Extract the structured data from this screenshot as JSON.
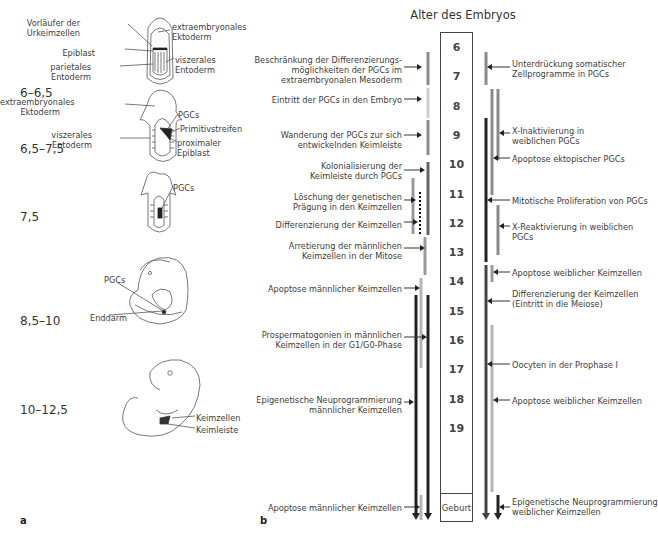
{
  "panel_a": {
    "letter": "a",
    "stages": [
      {
        "label": "6–6,5",
        "top": 86,
        "annotations": [
          {
            "text": "Vorläufer der\nUrkeimzellen",
            "x": 80,
            "y": 18,
            "align": "right"
          },
          {
            "text": "Epiblast",
            "x": 95,
            "y": 48,
            "align": "right"
          },
          {
            "text": "parietales\nEntoderm",
            "x": 91,
            "y": 62,
            "align": "right"
          },
          {
            "text": "extraembryonales\nEktoderm",
            "x": 172,
            "y": 22,
            "align": "left"
          },
          {
            "text": "viszerales\nEntoderm",
            "x": 175,
            "y": 55,
            "align": "left"
          }
        ]
      },
      {
        "label": "6,5–7,5",
        "top": 142,
        "annotations": [
          {
            "text": "extraembryonales\nEktoderm",
            "x": 60,
            "y": 97,
            "align": "right"
          },
          {
            "text": "viszerales\nEntoderm",
            "x": 92,
            "y": 130,
            "align": "right"
          },
          {
            "text": "PGCs",
            "x": 178,
            "y": 110,
            "align": "left"
          },
          {
            "text": "Primitivstreifen",
            "x": 180,
            "y": 124,
            "align": "left"
          },
          {
            "text": "proximaler\nEpiblast",
            "x": 177,
            "y": 138,
            "align": "left"
          }
        ]
      },
      {
        "label": "7,5",
        "top": 210,
        "annotations": [
          {
            "text": "PGCs",
            "x": 173,
            "y": 183,
            "align": "left"
          }
        ]
      },
      {
        "label": "8,5–10",
        "top": 314,
        "annotations": [
          {
            "text": "PGCs",
            "x": 104,
            "y": 275,
            "align": "left"
          },
          {
            "text": "Enddarm",
            "x": 90,
            "y": 313,
            "align": "left"
          }
        ]
      },
      {
        "label": "10–12,5",
        "top": 403,
        "annotations": [
          {
            "text": "Keimzellen",
            "x": 196,
            "y": 413,
            "align": "left"
          },
          {
            "text": "Keimleiste",
            "x": 196,
            "y": 425,
            "align": "left"
          }
        ]
      }
    ]
  },
  "panel_b": {
    "letter": "b",
    "title": "Alter des Embryos",
    "ages": [
      "6",
      "7",
      "8",
      "9",
      "10",
      "11",
      "12",
      "13",
      "14",
      "15",
      "16",
      "17",
      "18",
      "19"
    ],
    "birth_label": "Geburt",
    "left_events": [
      {
        "text": "Beschränkung der Differenzierungs-\nmöglichkeiten der PGCs im\nextraembryonalen Mesoderm",
        "y": 55,
        "arrow_y": 67,
        "arrow_to": 422
      },
      {
        "text": "Eintritt der PGCs in den Embryo",
        "y": 95,
        "arrow_y": 99,
        "arrow_to": 422
      },
      {
        "text": "Wanderung der PGCs zur sich\nentwickelnden Keimleiste",
        "y": 130,
        "arrow_y": 135,
        "arrow_to": 422
      },
      {
        "text": "Kolonialisierung der\nKeimleiste durch PGCs",
        "y": 161,
        "arrow_y": 170,
        "arrow_to": 425
      },
      {
        "text": "Löschung der genetischen\nPrägung in den Keimzellen",
        "y": 192,
        "arrow_y": 200,
        "arrow_to": 416
      },
      {
        "text": "Differenzierung der Keimzellen",
        "y": 220,
        "arrow_y": 222,
        "arrow_to": 418
      },
      {
        "text": "Arretierung der männlichen\nKeimzellen in der Mitose",
        "y": 241,
        "arrow_y": 248,
        "arrow_to": 425
      },
      {
        "text": "Apoptose männlicher Keimzellen",
        "y": 284,
        "arrow_y": 288,
        "arrow_to": 420
      },
      {
        "text": "Prospermatogonien in männlichen\nKeimzellen in der G1/G0-Phase",
        "y": 330,
        "arrow_y": 337,
        "arrow_to": 427
      },
      {
        "text": "Epigenetische Neuprogrammierung\nmännlicher Keimzellen",
        "y": 395,
        "arrow_y": 402,
        "arrow_to": 414
      },
      {
        "text": "Apoptose männlicher Keimzellen",
        "y": 503,
        "arrow_y": 507,
        "arrow_to": 420
      }
    ],
    "right_events": [
      {
        "text": "Unterdrückung somatischer\nZellprogramme in PGCs",
        "y": 59,
        "arrow_y": 67,
        "arrow_from": 487
      },
      {
        "text": "X-Inaktivierung in\nweiblichen PGCs",
        "y": 126,
        "arrow_y": 133,
        "arrow_from": 499
      },
      {
        "text": "Apoptose ektopischer PGCs",
        "y": 154,
        "arrow_y": 158,
        "arrow_from": 493
      },
      {
        "text": "Mitotische Proliferation von PGCs",
        "y": 196,
        "arrow_y": 200,
        "arrow_from": 487
      },
      {
        "text": "X-Reaktivierung in weiblichen\nPGCs",
        "y": 222,
        "arrow_y": 226,
        "arrow_from": 499
      },
      {
        "text": "Apoptose weiblicher Keimzellen",
        "y": 268,
        "arrow_y": 272,
        "arrow_from": 493
      },
      {
        "text": "Differenzierung der Keimzellen\n(Eintritt in die Meiose)",
        "y": 289,
        "arrow_y": 301,
        "arrow_from": 487
      },
      {
        "text": "Oocyten in der Prophase I",
        "y": 360,
        "arrow_y": 364,
        "arrow_from": 487
      },
      {
        "text": "Apoptose weiblicher Keimzellen",
        "y": 396,
        "arrow_y": 400,
        "arrow_from": 493
      },
      {
        "text": "Epigenetische Neuprogrammierung\nweiblicher Keimzellen",
        "y": 497,
        "arrow_y": 507,
        "arrow_from": 499
      }
    ],
    "bars": [
      {
        "x": 428,
        "y1": 52,
        "y2": 85,
        "color": "#8a8a8a",
        "w": 3
      },
      {
        "x": 428,
        "y1": 88,
        "y2": 118,
        "color": "#cfcfcf",
        "w": 3
      },
      {
        "x": 428,
        "y1": 120,
        "y2": 155,
        "color": "#8a8a8a",
        "w": 3
      },
      {
        "x": 428,
        "y1": 162,
        "y2": 235,
        "color": "#666666",
        "w": 3
      },
      {
        "x": 425,
        "y1": 237,
        "y2": 275,
        "color": "#9a9a9a",
        "w": 3
      },
      {
        "x": 421,
        "y1": 278,
        "y2": 368,
        "color": "#b5b5b5",
        "w": 3
      },
      {
        "x": 428,
        "y1": 295,
        "y2": 520,
        "color": "#222222",
        "w": 3,
        "arrow": true
      },
      {
        "x": 416,
        "y1": 295,
        "y2": 520,
        "color": "#222222",
        "w": 3,
        "arrow": true
      },
      {
        "x": 413,
        "y1": 178,
        "y2": 234,
        "color": "#9a9a9a",
        "w": 3
      },
      {
        "x": 420,
        "y1": 192,
        "y2": 236,
        "color": "#111111",
        "w": 2,
        "dotted": true
      },
      {
        "x": 421,
        "y1": 495,
        "y2": 520,
        "color": "#b5b5b5",
        "w": 3
      },
      {
        "x": 486,
        "y1": 52,
        "y2": 85,
        "color": "#8a8a8a",
        "w": 3
      },
      {
        "x": 492,
        "y1": 89,
        "y2": 195,
        "color": "#8a8a8a",
        "w": 3
      },
      {
        "x": 498,
        "y1": 89,
        "y2": 160,
        "color": "#8a8a8a",
        "w": 3
      },
      {
        "x": 486,
        "y1": 118,
        "y2": 262,
        "color": "#222222",
        "w": 3
      },
      {
        "x": 498,
        "y1": 205,
        "y2": 255,
        "color": "#8a8a8a",
        "w": 3
      },
      {
        "x": 492,
        "y1": 265,
        "y2": 282,
        "color": "#9a9a9a",
        "w": 3
      },
      {
        "x": 486,
        "y1": 265,
        "y2": 520,
        "color": "#444444",
        "w": 3,
        "arrow": true
      },
      {
        "x": 492,
        "y1": 325,
        "y2": 492,
        "color": "#b5b5b5",
        "w": 3
      },
      {
        "x": 498,
        "y1": 495,
        "y2": 520,
        "color": "#222222",
        "w": 3,
        "arrow": true
      }
    ]
  }
}
